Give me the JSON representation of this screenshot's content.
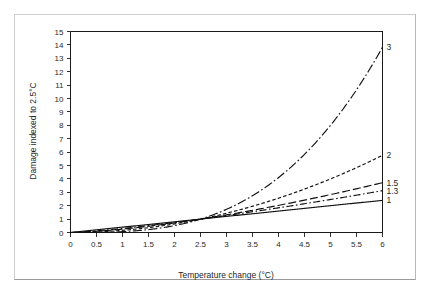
{
  "figure": {
    "frame_color": "#cfcfcf",
    "background": "#ffffff"
  },
  "chart_data": {
    "type": "line",
    "title": "",
    "subtitle": "",
    "xlabel": "Temperature change (°C)",
    "ylabel": "Damage indexed to 2.5°C",
    "xlim": [
      0,
      6
    ],
    "ylim": [
      0,
      15
    ],
    "grid": false,
    "legend_position": "right-end-labels",
    "reference_point": {
      "x": 2.5,
      "y": 1
    },
    "x_ticks": [
      "0",
      "0.5",
      "1",
      "1.5",
      "2",
      "2.5",
      "3",
      "3.5",
      "4",
      "4.5",
      "5",
      "5.5",
      "6"
    ],
    "x_tick_values": [
      0,
      0.5,
      1,
      1.5,
      2,
      2.5,
      3,
      3.5,
      4,
      4.5,
      5,
      5.5,
      6
    ],
    "y_ticks": [
      "0",
      "1",
      "2",
      "3",
      "4",
      "5",
      "6",
      "7",
      "8",
      "9",
      "10",
      "11",
      "12",
      "13",
      "14",
      "15"
    ],
    "y_tick_values": [
      0,
      1,
      2,
      3,
      4,
      5,
      6,
      7,
      8,
      9,
      10,
      11,
      12,
      13,
      14,
      15
    ],
    "x": [
      0,
      0.25,
      0.5,
      0.75,
      1,
      1.25,
      1.5,
      1.75,
      2,
      2.25,
      2.5,
      2.75,
      3,
      3.25,
      3.5,
      3.75,
      4,
      4.25,
      4.5,
      4.75,
      5,
      5.25,
      5.5,
      5.75,
      6
    ],
    "series": [
      {
        "name": "1",
        "label": "1",
        "exponent": 1,
        "style": "solid",
        "dasharray": "",
        "end_value": 2.4,
        "values": [
          0,
          0.1,
          0.2,
          0.3,
          0.4,
          0.5,
          0.6,
          0.7,
          0.8,
          0.9,
          1,
          1.1,
          1.2,
          1.3,
          1.4,
          1.5,
          1.6,
          1.7,
          1.8,
          1.9,
          2,
          2.1,
          2.2,
          2.3,
          2.4
        ]
      },
      {
        "name": "1.3",
        "label": "1.3",
        "exponent": 1.3,
        "style": "dash-dot",
        "dasharray": "7,2.5,1.6,2.5",
        "end_value": 2.92,
        "values": [
          0,
          0.06,
          0.14,
          0.24,
          0.34,
          0.45,
          0.57,
          0.69,
          0.81,
          0.9,
          1,
          1.13,
          1.26,
          1.4,
          1.54,
          1.68,
          1.82,
          1.97,
          2.12,
          2.27,
          2.43,
          2.59,
          2.75,
          2.91,
          3.08
        ]
      },
      {
        "name": "1.5",
        "label": "1.5",
        "exponent": 1.5,
        "style": "long-dash",
        "dasharray": "8,3",
        "end_value": 3.41,
        "values": [
          0,
          0.032,
          0.089,
          0.164,
          0.253,
          0.354,
          0.465,
          0.586,
          0.716,
          0.854,
          1,
          1.154,
          1.315,
          1.483,
          1.657,
          1.837,
          2.024,
          2.217,
          2.415,
          2.62,
          2.83,
          3.045,
          3.266,
          3.492,
          3.724
        ]
      },
      {
        "name": "2",
        "label": "2",
        "exponent": 2,
        "style": "short-dash",
        "dasharray": "3.5,2.2",
        "end_value": 5.76,
        "values": [
          0,
          0.01,
          0.04,
          0.09,
          0.16,
          0.25,
          0.36,
          0.49,
          0.64,
          0.81,
          1,
          1.21,
          1.44,
          1.69,
          1.96,
          2.25,
          2.56,
          2.89,
          3.24,
          3.61,
          4,
          4.41,
          4.84,
          5.29,
          5.76
        ]
      },
      {
        "name": "3",
        "label": "3",
        "exponent": 3,
        "style": "dash-dot-long",
        "dasharray": "9,2.5,1.6,2.5",
        "end_value": 13.82,
        "values": [
          0,
          0.001,
          0.008,
          0.027,
          0.064,
          0.125,
          0.216,
          0.343,
          0.512,
          0.729,
          1,
          1.331,
          1.728,
          2.197,
          2.744,
          3.375,
          4.096,
          4.913,
          5.832,
          6.859,
          8,
          9.261,
          10.648,
          12.167,
          13.824
        ]
      }
    ]
  }
}
